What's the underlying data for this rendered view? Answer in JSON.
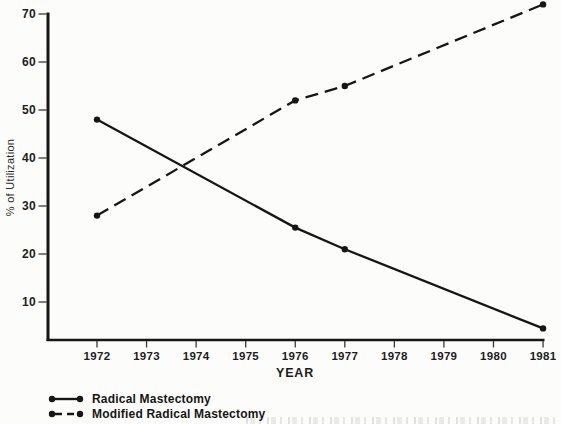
{
  "colors": {
    "ink": "#161616",
    "tick": "#3a3a3a",
    "background": "#fcfcfa"
  },
  "chart_data": {
    "type": "line",
    "title": "",
    "xlabel": "YEAR",
    "ylabel": "% of Utilization",
    "x": [
      1972,
      1976,
      1977,
      1981
    ],
    "x_ticks": [
      1972,
      1973,
      1974,
      1975,
      1976,
      1977,
      1978,
      1979,
      1980,
      1981
    ],
    "y_ticks": [
      10,
      20,
      30,
      40,
      50,
      60,
      70
    ],
    "xlim": [
      1971,
      1981
    ],
    "ylim": [
      0,
      72
    ],
    "grid": false,
    "legend_position": "bottom-left",
    "series": [
      {
        "name": "Radical Mastectomy",
        "line_style": "solid",
        "marker": "dot",
        "values": [
          48,
          25.5,
          21,
          4.5
        ]
      },
      {
        "name": "Modified Radical Mastectomy",
        "line_style": "dashed",
        "marker": "dot",
        "values": [
          28,
          52,
          55,
          72
        ]
      }
    ]
  }
}
